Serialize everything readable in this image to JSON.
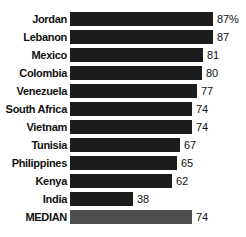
{
  "chart_data": {
    "type": "bar",
    "orientation": "horizontal",
    "title": "",
    "subtitle": "",
    "xlabel": "",
    "ylabel": "",
    "grid": false,
    "legend": false,
    "value_suffix_first_only": "%",
    "xlim": [
      0,
      100
    ],
    "categories": [
      "Jordan",
      "Lebanon",
      "Mexico",
      "Colombia",
      "Venezuela",
      "South Africa",
      "Vietnam",
      "Tunisia",
      "Philippines",
      "Kenya",
      "India",
      "MEDIAN"
    ],
    "values": [
      87,
      87,
      81,
      80,
      77,
      74,
      74,
      67,
      65,
      62,
      38,
      74
    ],
    "value_labels": [
      "87%",
      "87",
      "81",
      "80",
      "77",
      "74",
      "74",
      "67",
      "65",
      "62",
      "38",
      "74"
    ],
    "bar_colors": [
      "#1c1c1c",
      "#1c1c1c",
      "#1c1c1c",
      "#1c1c1c",
      "#1c1c1c",
      "#1c1c1c",
      "#1c1c1c",
      "#1c1c1c",
      "#1c1c1c",
      "#1c1c1c",
      "#1c1c1c",
      "#4e4e4e"
    ],
    "highlight_row": "MEDIAN",
    "highlight_color": "#4e4e4e",
    "bar_color": "#1c1c1c",
    "background_color": "#ffffff",
    "text_color": "#111111"
  }
}
